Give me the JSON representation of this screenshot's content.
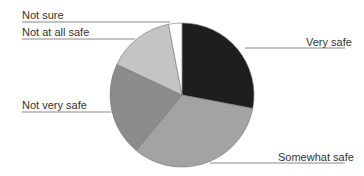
{
  "chart_data": {
    "type": "pie",
    "title": "",
    "categories": [
      "Very safe",
      "Somewhat safe",
      "Not very safe",
      "Not at all safe",
      "Not sure"
    ],
    "values": [
      28,
      33,
      21,
      15,
      3
    ],
    "colors": [
      "#1e1e1e",
      "#a3a3a3",
      "#8c8c8c",
      "#c4c4c4",
      "#ffffff"
    ],
    "start_angle_deg": 0,
    "direction": "clockwise",
    "legend": "none (leader-line labels)"
  },
  "labels": {
    "very_safe": "Very safe",
    "somewhat_safe": "Somewhat safe",
    "not_very_safe": "Not very safe",
    "not_at_all_safe": "Not at all safe",
    "not_sure": "Not sure"
  }
}
